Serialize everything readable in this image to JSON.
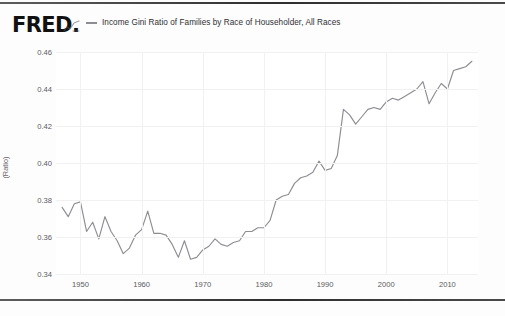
{
  "brand": {
    "logo_text": "FRED",
    "logo_suffix": ".",
    "squiggle_icon": "chart-squiggle-icon"
  },
  "legend": {
    "marker": "line-dash-marker",
    "label": "Income Gini Ratio of Families by Race of Householder, All Races",
    "color": "#8d8d93"
  },
  "chart_data": {
    "type": "line",
    "title": "",
    "xlabel": "",
    "ylabel": "(Ratio)",
    "xlim": [
      1946,
      2015
    ],
    "ylim": [
      0.34,
      0.46
    ],
    "xticks": [
      "1950",
      "1960",
      "1970",
      "1980",
      "1990",
      "2000",
      "2010"
    ],
    "xtick_values": [
      1950,
      1960,
      1970,
      1980,
      1990,
      2000,
      2010
    ],
    "yticks": [
      "0.34",
      "0.36",
      "0.38",
      "0.40",
      "0.42",
      "0.44",
      "0.46"
    ],
    "ytick_values": [
      0.34,
      0.36,
      0.38,
      0.4,
      0.42,
      0.44,
      0.46
    ],
    "grid": true,
    "legend_position": "top",
    "line_color": "#8d8d93",
    "series": [
      {
        "name": "Income Gini Ratio of Families by Race of Householder, All Races",
        "x": [
          1947,
          1948,
          1949,
          1950,
          1951,
          1952,
          1953,
          1954,
          1955,
          1956,
          1957,
          1958,
          1959,
          1960,
          1961,
          1962,
          1963,
          1964,
          1965,
          1966,
          1967,
          1968,
          1969,
          1970,
          1971,
          1972,
          1973,
          1974,
          1975,
          1976,
          1977,
          1978,
          1979,
          1980,
          1981,
          1982,
          1983,
          1984,
          1985,
          1986,
          1987,
          1988,
          1989,
          1990,
          1991,
          1992,
          1993,
          1994,
          1995,
          1996,
          1997,
          1998,
          1999,
          2000,
          2001,
          2002,
          2003,
          2004,
          2005,
          2006,
          2007,
          2008,
          2009,
          2010,
          2011,
          2012,
          2013,
          2014
        ],
        "values": [
          0.376,
          0.371,
          0.378,
          0.379,
          0.363,
          0.368,
          0.359,
          0.371,
          0.363,
          0.358,
          0.351,
          0.354,
          0.361,
          0.364,
          0.374,
          0.362,
          0.362,
          0.361,
          0.356,
          0.349,
          0.358,
          0.348,
          0.349,
          0.353,
          0.355,
          0.359,
          0.356,
          0.355,
          0.357,
          0.358,
          0.363,
          0.363,
          0.365,
          0.365,
          0.369,
          0.38,
          0.382,
          0.383,
          0.389,
          0.392,
          0.393,
          0.395,
          0.401,
          0.396,
          0.397,
          0.404,
          0.429,
          0.426,
          0.421,
          0.425,
          0.429,
          0.43,
          0.429,
          0.433,
          0.435,
          0.434,
          0.436,
          0.438,
          0.44,
          0.444,
          0.432,
          0.438,
          0.443,
          0.44,
          0.45,
          0.451,
          0.452,
          0.455
        ]
      }
    ]
  }
}
